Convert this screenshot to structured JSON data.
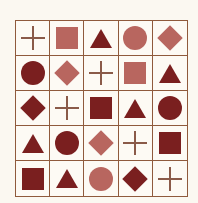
{
  "colors": {
    "dark": "#7a1f1f",
    "light": "#b8665f",
    "plus": "#8a5a48",
    "grid_line": "#8f5a3c"
  },
  "rows": [
    [
      {
        "shape": "plus",
        "tone": "plus"
      },
      {
        "shape": "square",
        "tone": "light"
      },
      {
        "shape": "triangle",
        "tone": "dark"
      },
      {
        "shape": "circle",
        "tone": "light"
      },
      {
        "shape": "diamond",
        "tone": "light"
      }
    ],
    [
      {
        "shape": "circle",
        "tone": "dark"
      },
      {
        "shape": "diamond",
        "tone": "light"
      },
      {
        "shape": "plus",
        "tone": "plus"
      },
      {
        "shape": "square",
        "tone": "light"
      },
      {
        "shape": "triangle",
        "tone": "dark"
      }
    ],
    [
      {
        "shape": "diamond",
        "tone": "dark"
      },
      {
        "shape": "plus",
        "tone": "plus"
      },
      {
        "shape": "square",
        "tone": "dark"
      },
      {
        "shape": "triangle",
        "tone": "dark"
      },
      {
        "shape": "circle",
        "tone": "dark"
      }
    ],
    [
      {
        "shape": "triangle",
        "tone": "dark"
      },
      {
        "shape": "circle",
        "tone": "dark"
      },
      {
        "shape": "diamond",
        "tone": "light"
      },
      {
        "shape": "plus",
        "tone": "plus"
      },
      {
        "shape": "square",
        "tone": "dark"
      }
    ],
    [
      {
        "shape": "square",
        "tone": "dark"
      },
      {
        "shape": "triangle",
        "tone": "dark"
      },
      {
        "shape": "circle",
        "tone": "light"
      },
      {
        "shape": "diamond",
        "tone": "dark"
      },
      {
        "shape": "plus",
        "tone": "plus"
      }
    ]
  ]
}
